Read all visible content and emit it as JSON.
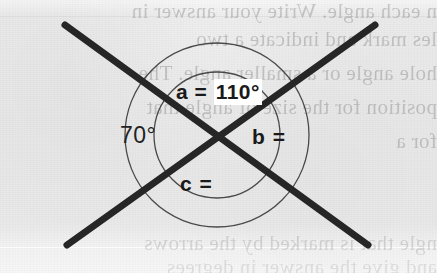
{
  "figure": {
    "background_color": "#e9e9e9",
    "ink_color": "#262626",
    "arc_color": "#3a3a3a",
    "highlight_color": "#ffffff"
  },
  "labels": {
    "angle_a": {
      "name": "a",
      "prefix": "a = ",
      "value": "110°",
      "full": "a = 110°",
      "highlighted": true
    },
    "angle_70": {
      "name": "given",
      "value": "70°",
      "full": "70°",
      "highlighted": false
    },
    "angle_b": {
      "name": "b",
      "prefix": "b =",
      "value": "",
      "full": "b =",
      "highlighted": false
    },
    "angle_c": {
      "name": "c",
      "prefix": "c =",
      "value": "",
      "full": "c =",
      "highlighted": false
    }
  },
  "geometry": {
    "intersection": {
      "x": 217,
      "y": 135
    },
    "line_1": {
      "from": {
        "x": 65,
        "y": 25
      },
      "to": {
        "x": 368,
        "y": 245
      }
    },
    "line_2": {
      "from": {
        "x": 375,
        "y": 25
      },
      "to": {
        "x": 67,
        "y": 245
      }
    },
    "outer_circle": {
      "cx": 217,
      "cy": 135,
      "r": 92
    },
    "inner_circle": {
      "cx": 217,
      "cy": 135,
      "r": 63
    },
    "line_width": 7
  },
  "bleed_text": {
    "lines": [
      "n each angle. Write your answer in",
      "les mark and indicate a two",
      "hole angle or a smaller angle. The",
      "position for the size of angle that",
      "for a"
    ],
    "lower_lines": [
      "ngle that is marked by the arrows",
      "and give the answer in degrees"
    ]
  }
}
